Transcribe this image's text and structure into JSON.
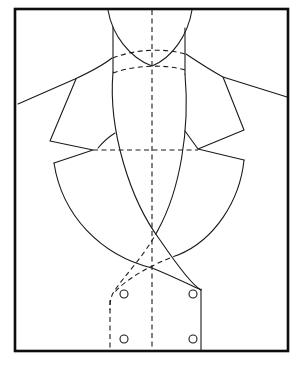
{
  "diagram": {
    "type": "garment-pattern-line-drawing",
    "colors": {
      "line": "#1a1a1a",
      "frame": "#0d0d0d",
      "background": "#ffffff"
    },
    "frame": {
      "x": 15,
      "y": 9,
      "width": 273,
      "height": 342
    },
    "center_line": {
      "x": 152,
      "y1": 9,
      "y2": 351,
      "style": "dashed"
    },
    "buttons": [
      {
        "cx": 124,
        "cy": 294,
        "r": 4
      },
      {
        "cx": 193,
        "cy": 294,
        "r": 4
      },
      {
        "cx": 124,
        "cy": 339,
        "r": 4
      },
      {
        "cx": 193,
        "cy": 339,
        "r": 4
      }
    ],
    "labels": []
  }
}
